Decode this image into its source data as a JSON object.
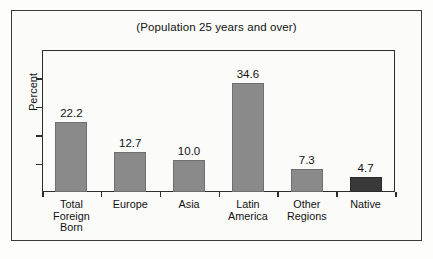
{
  "chart_data": {
    "type": "bar",
    "title": "(Population 25 years and over)",
    "xlabel": "",
    "ylabel": "Percent",
    "ylim": [
      0,
      45
    ],
    "grid": false,
    "legend": "none",
    "tick_labels_y": [],
    "y_tick_count": 4,
    "categories": [
      "Total Foreign Born",
      "Europe",
      "Asia",
      "Latin America",
      "Other Regions",
      "Native"
    ],
    "category_lines": [
      [
        "Total",
        "Foreign",
        "Born"
      ],
      [
        "Europe"
      ],
      [
        "Asia"
      ],
      [
        "Latin",
        "America"
      ],
      [
        "Other",
        "Regions"
      ],
      [
        "Native"
      ]
    ],
    "values": [
      22.2,
      12.7,
      10.0,
      34.6,
      7.3,
      4.7
    ],
    "value_labels": [
      "22.2",
      "12.7",
      "10.0",
      "34.6",
      "7.3",
      "4.7"
    ],
    "bar_colors": [
      "#8a8a8a",
      "#8a8a8a",
      "#8a8a8a",
      "#8a8a8a",
      "#8a8a8a",
      "#3a3a3a"
    ]
  },
  "colors": {
    "bar_gray": "#8a8a8a",
    "bar_dark": "#3a3a3a",
    "axis": "#2d2d2d",
    "frame": "#3a3a3a",
    "text": "#111111",
    "background": "#fbfbfa"
  }
}
